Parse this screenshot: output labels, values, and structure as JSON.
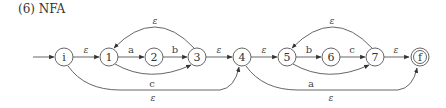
{
  "title": "(6)  NFA",
  "diagram": {
    "type": "nfa",
    "start_state": "i",
    "accept_states": [
      "f"
    ],
    "states": [
      {
        "id": "i",
        "label": "i",
        "x": 64,
        "y": 57,
        "accepting": false
      },
      {
        "id": "1",
        "label": "1",
        "x": 109,
        "y": 57,
        "accepting": false
      },
      {
        "id": "2",
        "label": "2",
        "x": 154,
        "y": 57,
        "accepting": false
      },
      {
        "id": "3",
        "label": "3",
        "x": 197,
        "y": 57,
        "accepting": false
      },
      {
        "id": "4",
        "label": "4",
        "x": 242,
        "y": 57,
        "accepting": false
      },
      {
        "id": "5",
        "label": "5",
        "x": 287,
        "y": 57,
        "accepting": false
      },
      {
        "id": "6",
        "label": "6",
        "x": 331,
        "y": 57,
        "accepting": false
      },
      {
        "id": "7",
        "label": "7",
        "x": 375,
        "y": 57,
        "accepting": false
      },
      {
        "id": "f",
        "label": "f",
        "x": 420,
        "y": 57,
        "accepting": true
      }
    ],
    "transitions": [
      {
        "from": "i",
        "to": "1",
        "label": "ε"
      },
      {
        "from": "1",
        "to": "2",
        "label": "a"
      },
      {
        "from": "2",
        "to": "3",
        "label": "b"
      },
      {
        "from": "1",
        "to": "3",
        "label": "c"
      },
      {
        "from": "3",
        "to": "1",
        "label": "ε"
      },
      {
        "from": "3",
        "to": "4",
        "label": "ε"
      },
      {
        "from": "i",
        "to": "4",
        "label": "ε"
      },
      {
        "from": "4",
        "to": "5",
        "label": "ε"
      },
      {
        "from": "5",
        "to": "6",
        "label": "b"
      },
      {
        "from": "6",
        "to": "7",
        "label": "c"
      },
      {
        "from": "5",
        "to": "7",
        "label": "a"
      },
      {
        "from": "7",
        "to": "5",
        "label": "ε"
      },
      {
        "from": "7",
        "to": "f",
        "label": "ε"
      },
      {
        "from": "4",
        "to": "f",
        "label": "ε"
      }
    ]
  },
  "labels": {
    "i_1": "ε",
    "1_2": "a",
    "2_3": "b",
    "1_3": "c",
    "3_1": "ε",
    "3_4": "ε",
    "i_4": "ε",
    "4_5": "ε",
    "5_6": "b",
    "6_7": "c",
    "5_7": "a",
    "7_5": "ε",
    "7_f": "ε",
    "4_f": "ε"
  },
  "nodes": {
    "i": "i",
    "n1": "1",
    "n2": "2",
    "n3": "3",
    "n4": "4",
    "n5": "5",
    "n6": "6",
    "n7": "7",
    "f": "f"
  }
}
